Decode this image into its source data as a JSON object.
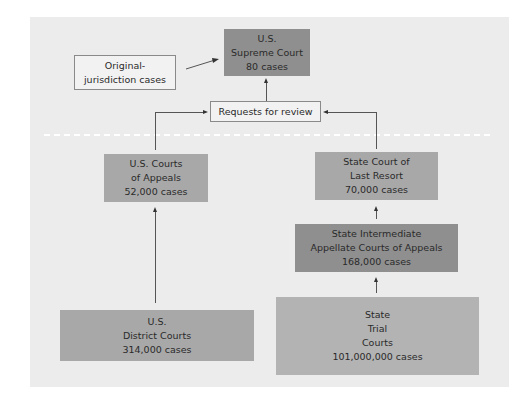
{
  "diagram": {
    "title": "",
    "nodes": {
      "supreme": {
        "line1": "U.S.",
        "line2": "Supreme Court",
        "line3": "80 cases"
      },
      "original": {
        "line1": "Original-",
        "line2": "jurisdiction cases"
      },
      "requests": {
        "label": "Requests for review"
      },
      "us_appeals": {
        "line1": "U.S. Courts",
        "line2": "of Appeals",
        "line3": "52,000 cases"
      },
      "state_last_resort": {
        "line1": "State Court of",
        "line2": "Last Resort",
        "line3": "70,000 cases"
      },
      "state_intermediate": {
        "line1": "State Intermediate",
        "line2": "Appellate Courts of Appeals",
        "line3": "168,000 cases"
      },
      "us_district": {
        "line1": "U.S.",
        "line2": "District Courts",
        "line3": "314,000 cases"
      },
      "state_trial": {
        "line1": "State",
        "line2": "Trial",
        "line3": "Courts",
        "line4": "101,000,000 cases"
      }
    },
    "edges": [
      {
        "from": "original",
        "to": "supreme"
      },
      {
        "from": "requests",
        "to": "supreme"
      },
      {
        "from": "us_appeals",
        "to": "requests"
      },
      {
        "from": "state_last_resort",
        "to": "requests"
      },
      {
        "from": "us_district",
        "to": "us_appeals"
      },
      {
        "from": "state_intermediate",
        "to": "state_last_resort"
      },
      {
        "from": "state_trial",
        "to": "state_intermediate"
      }
    ],
    "colors": {
      "panel": "#ececec",
      "dark_box": "#8f8f8f",
      "mid_box": "#a8a8a8",
      "light_box": "#b3b3b3",
      "outline_box": "#f2f2f2"
    }
  }
}
